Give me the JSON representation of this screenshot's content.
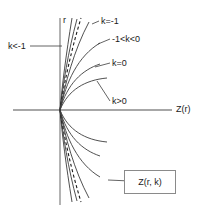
{
  "figure": {
    "axes": {
      "x_axis_label": "Z(r)",
      "y_axis_label": "r"
    },
    "boxed_label": "Z(r, k)",
    "curve_labels": {
      "k_lt_minus1": "k<-1",
      "k_eq_minus1": "k=-1",
      "k_between": "-1<k<0",
      "k_eq_0": "k=0",
      "k_gt_0": "k>0"
    },
    "colors": {
      "axis": "#8a8a8a",
      "curve": "#3c3c3c",
      "dashed_curve": "#1a1a1a",
      "box_border": "#8a8a8a",
      "text": "#1a1a1a",
      "background": "#ffffff"
    }
  },
  "chart_data": {
    "type": "line",
    "title": "",
    "xlabel": "Z(r)",
    "ylabel": "r",
    "grid": false,
    "legend_position": "inline-annotations",
    "axis_origin_px": {
      "x": 60,
      "y": 110
    },
    "xlim": [
      13,
      172
    ],
    "ylim": [
      18,
      205
    ],
    "annotations": [
      {
        "text": "k<-1",
        "x": 8,
        "y": 42,
        "leader_to": {
          "x": 62,
          "y": 46
        }
      },
      {
        "text": "k=-1",
        "x": 101,
        "y": 17,
        "leader_to": {
          "x": 92,
          "y": 24
        }
      },
      {
        "text": "-1<k<0",
        "x": 112,
        "y": 35,
        "leader_to": {
          "x": 98,
          "y": 44
        }
      },
      {
        "text": "k=0",
        "x": 112,
        "y": 59,
        "leader_to": {
          "x": 95,
          "y": 67
        }
      },
      {
        "text": "k>0",
        "x": 112,
        "y": 97,
        "leader_to": {
          "x": 97,
          "y": 81
        }
      },
      {
        "text": "Z(r, k)",
        "x": 132,
        "y": 177,
        "leader_to": {
          "x": 108,
          "y": 180
        }
      }
    ],
    "series": [
      {
        "name": "k<-1 (steepest, upper)",
        "k": -2.0,
        "branch": "upper",
        "style": "solid",
        "path": "M 60,110 C 62,86 66,55 72,18"
      },
      {
        "name": "k<-1 (upper)",
        "k": -1.6,
        "branch": "upper",
        "style": "solid",
        "path": "M 60,110 C 63,85 68,52 77,19"
      },
      {
        "name": "k=-1 asymptote (upper)",
        "k": -1.0,
        "branch": "upper",
        "style": "dashed",
        "path": "M 60,110 C 64,84 71,51 81,18"
      },
      {
        "name": "k=-1 (upper)",
        "k": -1.0,
        "branch": "upper",
        "style": "solid",
        "path": "M 60,110 C 65,84 74,50 89,22"
      },
      {
        "name": "-1<k<0 (upper)",
        "k": -0.5,
        "branch": "upper",
        "style": "solid",
        "path": "M 60,110 C 66,82 78,56 100,43"
      },
      {
        "name": "k=0 (upper)",
        "k": 0.0,
        "branch": "upper",
        "style": "solid",
        "path": "M 60,110 C 67,84 82,70 100,64"
      },
      {
        "name": "k>0 (flattest, upper)",
        "k": 1.0,
        "branch": "upper",
        "style": "solid",
        "path": "M 60,110 C 68,90 85,80 107,78"
      },
      {
        "name": "k<-1 (steepest, lower)",
        "k": -2.0,
        "branch": "lower",
        "style": "solid",
        "path": "M 60,110 C 62,134 66,165 72,202"
      },
      {
        "name": "k<-1 (lower)",
        "k": -1.6,
        "branch": "lower",
        "style": "solid",
        "path": "M 60,110 C 63,135 68,168 77,201"
      },
      {
        "name": "k=-1 asymptote (lower)",
        "k": -1.0,
        "branch": "lower",
        "style": "dashed",
        "path": "M 60,110 C 64,136 71,169 81,202"
      },
      {
        "name": "k=-1 (lower)",
        "k": -1.0,
        "branch": "lower",
        "style": "solid",
        "path": "M 60,110 C 65,136 74,170 89,198"
      },
      {
        "name": "-1<k<0 (lower)",
        "k": -0.5,
        "branch": "lower",
        "style": "solid",
        "path": "M 60,110 C 66,138 78,164 100,177"
      },
      {
        "name": "k=0 (lower)",
        "k": 0.0,
        "branch": "lower",
        "style": "solid",
        "path": "M 60,110 C 67,136 82,150 100,156"
      },
      {
        "name": "k>0 (flattest, lower)",
        "k": 1.0,
        "branch": "lower",
        "style": "solid",
        "path": "M 60,110 C 68,130 85,140 107,142"
      }
    ]
  }
}
